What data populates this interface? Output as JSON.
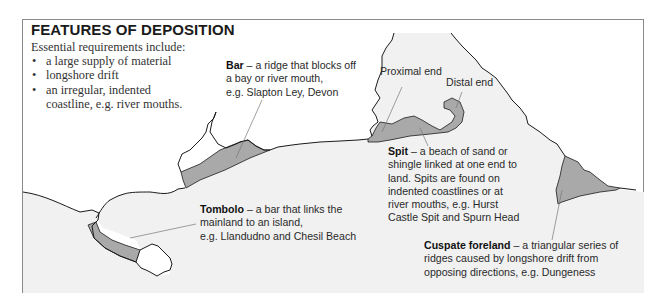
{
  "title": "FEATURES OF DEPOSITION",
  "intro": {
    "lead": "Essential requirements include:",
    "bullets": [
      {
        "symbol": "•",
        "text": "a large supply of material"
      },
      {
        "symbol": "•",
        "text": "longshore drift"
      },
      {
        "symbol": "•",
        "text": "an irregular, indented"
      }
    ],
    "bullet3_cont": "coastline, e.g. river mouths."
  },
  "labels": {
    "bar": {
      "name": "Bar",
      "dash": " – ",
      "lines": [
        "a ridge that blocks off",
        "a bay or river mouth,",
        "e.g. Slapton Ley, Devon"
      ]
    },
    "proximal_end": "Proximal end",
    "distal_end": "Distal end",
    "spit": {
      "name": "Spit",
      "dash": " – ",
      "lines": [
        "a beach of sand or",
        "shingle linked at one end to",
        "land. Spits are found on",
        "indented coastlines or at",
        "river mouths, e.g. Hurst",
        "Castle Spit and Spurn Head"
      ]
    },
    "tombolo": {
      "name": "Tombolo",
      "dash": " – ",
      "lines": [
        "a bar that links the",
        "mainland to an island,",
        "e.g. Llandudno and Chesil Beach"
      ]
    },
    "cuspate": {
      "name": "Cuspate foreland",
      "dash": " – ",
      "lines": [
        "a triangular series of",
        "ridges caused by longshore drift from",
        "opposing directions, e.g. Dungeness"
      ]
    }
  },
  "colors": {
    "sea": "#f1f1f1",
    "land": "#ffffff",
    "deposit": "#a9a9a9",
    "coastline": "#1a1a1a",
    "frame": "#8a8a8a",
    "leader": "#777777"
  }
}
